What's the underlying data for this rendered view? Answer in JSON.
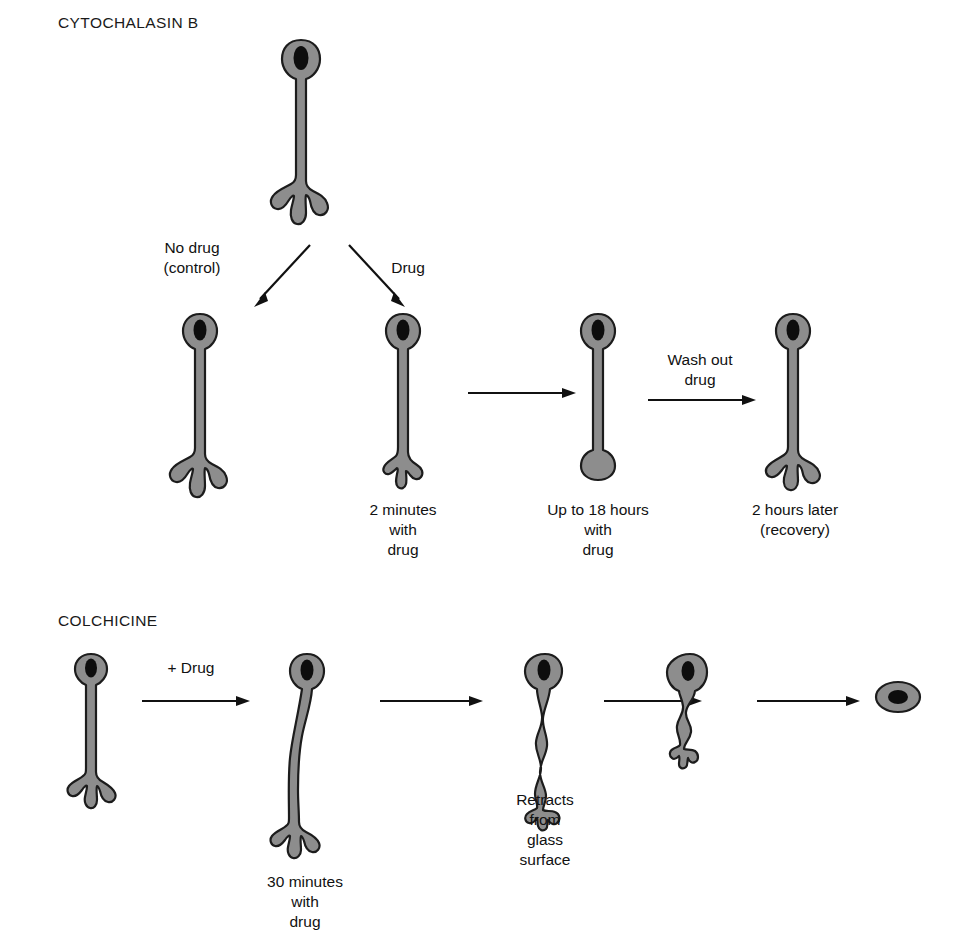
{
  "figure": {
    "kind": "cell-morphology-flow-diagram",
    "background_color": "#ffffff",
    "cell_fill_color": "#8d8d8d",
    "cell_outline_color": "#1c1c1c",
    "nucleus_color": "#0d0d0d",
    "arrow_color": "#111111"
  },
  "sections": [
    {
      "id": "cytochalasin-b",
      "title": "CYTOCHALASIN B"
    },
    {
      "id": "colchicine",
      "title": "COLCHICINE"
    }
  ],
  "cytochalasin": {
    "title": "CYTOCHALASIN B",
    "branch_labels": {
      "control": "No drug\n(control)",
      "drug": "Drug"
    },
    "washout_label": "Wash out\ndrug",
    "cells": [
      {
        "id": "parent",
        "caption": ""
      },
      {
        "id": "control",
        "caption": ""
      },
      {
        "id": "two-minutes",
        "caption": "2 minutes\nwith\ndrug"
      },
      {
        "id": "eighteen-hours",
        "caption": "Up to 18 hours\nwith\ndrug"
      },
      {
        "id": "recovery",
        "caption": "2 hours later\n(recovery)"
      }
    ]
  },
  "colchicine": {
    "title": "COLCHICINE",
    "add_drug_label": "+ Drug",
    "cells": [
      {
        "id": "untreated",
        "caption": ""
      },
      {
        "id": "thirty-minutes",
        "caption": "30 minutes\nwith\ndrug"
      },
      {
        "id": "retracting",
        "caption": "Retracts\nfrom\nglass\nsurface"
      },
      {
        "id": "kinked",
        "caption": ""
      },
      {
        "id": "rounded",
        "caption": ""
      }
    ]
  }
}
